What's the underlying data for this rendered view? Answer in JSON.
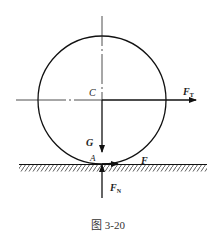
{
  "diagram": {
    "caption": "图 3-20",
    "center_label": "C",
    "contact_label": "A",
    "forces": {
      "tension": {
        "symbol": "F",
        "subscript": "T"
      },
      "gravity": {
        "symbol": "G"
      },
      "friction": {
        "symbol": "F"
      },
      "normal": {
        "symbol": "F",
        "subscript": "N"
      }
    }
  }
}
